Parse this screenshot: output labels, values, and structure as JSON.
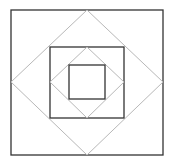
{
  "diagram": {
    "title": "",
    "canvas": {
      "width": 171,
      "height": 160,
      "background": "#ffffff"
    },
    "colors": {
      "square_stroke": "#333333",
      "diamond_stroke": "#b8b8b8"
    },
    "squares": [
      {
        "name": "outer-square",
        "x": 11,
        "y": 10,
        "w": 152,
        "h": 145
      },
      {
        "name": "middle-square",
        "x": 50,
        "y": 47,
        "w": 74,
        "h": 71
      },
      {
        "name": "inner-square",
        "x": 69,
        "y": 65,
        "w": 36,
        "h": 34
      }
    ],
    "diamonds": [
      {
        "name": "outer-diamond",
        "points": "87,10 163,82 87,155 11,82"
      },
      {
        "name": "inner-diamond",
        "points": "87,47 124,82 87,118 50,82"
      }
    ]
  }
}
